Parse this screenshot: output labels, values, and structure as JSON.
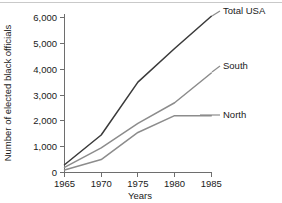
{
  "chart_data": {
    "type": "line",
    "title": "",
    "xlabel": "Years",
    "ylabel": "Number of elected black officials",
    "x": [
      1965,
      1970,
      1975,
      1980,
      1985
    ],
    "xlim": [
      1965,
      1985
    ],
    "ylim": [
      0,
      6000
    ],
    "xticks": [
      "1965",
      "1970",
      "1975",
      "1980",
      "1985"
    ],
    "yticks": [
      "0",
      "1,000",
      "2,000",
      "3,000",
      "4,000",
      "5,000",
      "6,000"
    ],
    "ytick_values": [
      0,
      1000,
      2000,
      3000,
      4000,
      5000,
      6000
    ],
    "grid": false,
    "legend_position": "right-inline-labels",
    "series": [
      {
        "name": "Total USA",
        "label": "Total USA",
        "color": "#3a3a3a",
        "values": [
          300,
          1450,
          3500,
          4800,
          6050
        ]
      },
      {
        "name": "South",
        "label": "South",
        "color": "#8c8c8c",
        "values": [
          200,
          950,
          1900,
          2700,
          3850
        ]
      },
      {
        "name": "North",
        "label": "North",
        "color": "#8c8c8c",
        "values": [
          100,
          500,
          1550,
          2200,
          2200
        ]
      }
    ]
  }
}
